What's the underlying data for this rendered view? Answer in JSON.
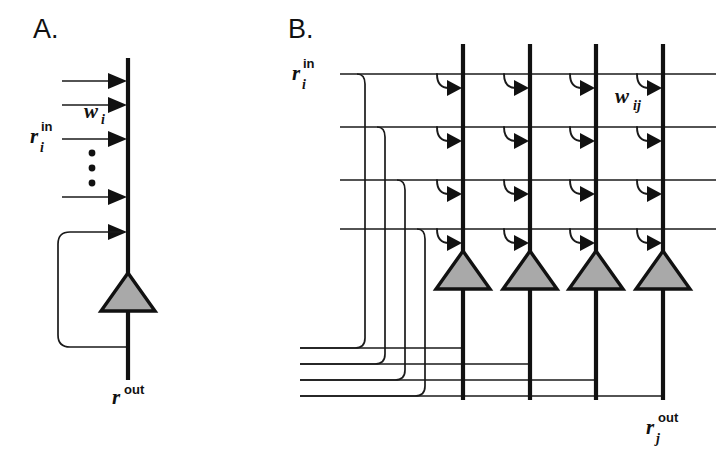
{
  "figure": {
    "background_color": "#ffffff",
    "ink_color": "#111111",
    "soma_fill_color": "#a9a9a9",
    "width": 723,
    "height": 455
  },
  "panel_a": {
    "letter": "A.",
    "letter_pos": {
      "x": 33,
      "y": 38
    },
    "trunk": {
      "x": 128,
      "y_top": 58,
      "y_bottom": 380
    },
    "soma": {
      "cx": 128,
      "cy": 310,
      "half_width": 26,
      "height": 38
    },
    "axon_label": {
      "base": "r",
      "superscript": "out",
      "subscript": "",
      "x": 112,
      "y": 404
    },
    "weight_label": {
      "base": "w",
      "subscript": "i",
      "superscript": "",
      "x": 84,
      "y": 118
    },
    "input_label": {
      "base": "r",
      "subscript": "i",
      "superscript": "in",
      "x": 30,
      "y": 143
    },
    "input_rows_y": [
      81,
      105,
      139,
      197
    ],
    "input_line_x_start": 62,
    "feedback_row_y": 232,
    "feedback_left_x": 58,
    "feedback_bottom_y": 347,
    "ellipsis_dots_y": [
      153,
      168,
      183
    ],
    "ellipsis_dot_x": 92,
    "synapse_count": 5
  },
  "panel_b": {
    "letter": "B.",
    "letter_pos": {
      "x": 288,
      "y": 38
    },
    "input_label": {
      "base": "r",
      "subscript": "i",
      "superscript": "in",
      "x": 292,
      "y": 80
    },
    "weight_label": {
      "base": "w",
      "subscript": "ij",
      "superscript": "",
      "x": 620,
      "y": 103
    },
    "output_label": {
      "base": "r",
      "subscript": "j",
      "superscript": "out",
      "x": 646,
      "y": 434
    },
    "row_y": [
      74,
      127,
      180,
      229
    ],
    "row_x_start": 340,
    "row_x_end": 716,
    "dendrite_x": [
      463,
      530,
      596,
      663
    ],
    "dendrite_y_top": 44,
    "dendrite_y_bottom": 400,
    "soma_cy": 288,
    "soma_half_width": 26,
    "soma_height": 38,
    "feedback_riser_x": [
      365,
      385,
      405,
      425
    ],
    "feedback_branch_y": [
      348,
      364,
      380,
      396
    ],
    "neuron_count": 4,
    "synapses_per_neuron": 4,
    "total_synapses": 16
  }
}
